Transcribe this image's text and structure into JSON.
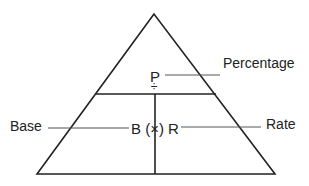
{
  "diagram": {
    "colors": {
      "stroke": "#222222",
      "leader": "#555555",
      "background": "#ffffff"
    },
    "symbols": {
      "top": "P",
      "divide": "÷",
      "bottom": "B (×) R"
    },
    "labels": {
      "percentage": "Percentage",
      "base": "Base",
      "rate": "Rate"
    }
  }
}
